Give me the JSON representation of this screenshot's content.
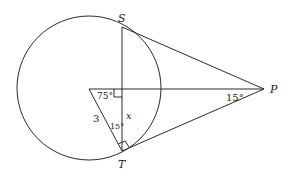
{
  "diagram": {
    "type": "geometry",
    "circle": {
      "cx": 89,
      "cy": 88,
      "r": 72
    },
    "points": {
      "S": {
        "label": "S",
        "x": 122,
        "y": 27
      },
      "T": {
        "label": "T",
        "x": 122,
        "y": 151
      },
      "P": {
        "label": "P",
        "x": 264,
        "y": 89
      },
      "A": {
        "x": 89,
        "y": 89
      },
      "F": {
        "x": 122,
        "y": 89
      }
    },
    "labels": {
      "S": "S",
      "T": "T",
      "P": "P",
      "angle_A": "75°",
      "angle_T": "15°",
      "angle_P": "15°",
      "side_AT": "3",
      "segment_x": "x"
    }
  }
}
